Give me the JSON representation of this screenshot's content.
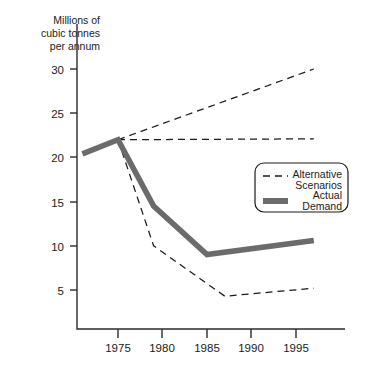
{
  "chart_data": {
    "type": "line",
    "title": "",
    "xlabel": "",
    "ylabel": "Millions of cubic tonnes per annum",
    "ylabel_lines": [
      "Millions of",
      "cubic tonnes",
      "per annum"
    ],
    "xlim": [
      1971,
      1997
    ],
    "ylim": [
      0,
      32
    ],
    "yticks": [
      5,
      10,
      15,
      20,
      25,
      30
    ],
    "ytick_labels": [
      "5",
      "10",
      "15",
      "20",
      "25",
      "30"
    ],
    "xticks": [
      1975,
      1980,
      1985,
      1990,
      1995
    ],
    "xtick_labels": [
      "1975",
      "1980",
      "1985",
      "1990",
      "1995"
    ],
    "grid": false,
    "legend_position": "center-right",
    "series": [
      {
        "name": "Actual Demand",
        "style": "thick-solid",
        "color": "#6b6b6b",
        "x": [
          1971,
          1975,
          1979,
          1985,
          1997
        ],
        "values": [
          20.4,
          22.0,
          14.5,
          9.0,
          10.6
        ]
      },
      {
        "name": "Alternative Scenario High",
        "style": "dashed",
        "color": "#1a1a1a",
        "x": [
          1975,
          1997
        ],
        "values": [
          22.0,
          30.0
        ]
      },
      {
        "name": "Alternative Scenario Flat",
        "style": "dashed",
        "color": "#1a1a1a",
        "x": [
          1975,
          1997
        ],
        "values": [
          22.0,
          22.1
        ]
      },
      {
        "name": "Alternative Scenario Low",
        "style": "dashed",
        "color": "#1a1a1a",
        "x": [
          1975,
          1979,
          1987,
          1997
        ],
        "values": [
          22.0,
          10.0,
          4.3,
          5.2
        ]
      }
    ],
    "legend_entries": [
      {
        "label_lines": [
          "Alternative",
          "Scenarios"
        ],
        "marker": "dashed"
      },
      {
        "label_lines": [
          "Actual",
          "Demand"
        ],
        "marker": "thick-bar"
      }
    ]
  }
}
